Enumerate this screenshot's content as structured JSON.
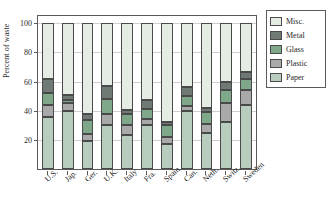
{
  "figure": {
    "title_fragment": "",
    "background": "#ffffff"
  },
  "chart_data": {
    "type": "bar",
    "stacked": true,
    "title": "",
    "subtitle": "",
    "xlabel": "",
    "ylabel": "Percent of waste",
    "ylim": [
      0,
      105
    ],
    "yticks": [
      20,
      40,
      60,
      80,
      100
    ],
    "ytick_labels": [
      "20",
      "40",
      "60",
      "80",
      "100"
    ],
    "grid": true,
    "legend_position": "right",
    "categories": [
      "U.S.",
      "Jap.",
      "Ger.",
      "U.K.",
      "Italy",
      "Fra.",
      "Spain",
      "Can.",
      "Neth.",
      "Switz.",
      "Sweden"
    ],
    "series": [
      {
        "name": "Paper",
        "color": "#b8cdbd",
        "values": [
          36,
          40,
          19.5,
          30,
          23.5,
          30,
          17,
          39.5,
          24.5,
          32,
          44
        ]
      },
      {
        "name": "Plastic",
        "color": "#a9a9a9",
        "values": [
          8,
          5,
          4.5,
          7.5,
          6.5,
          4,
          5,
          4,
          6.5,
          13,
          10
        ]
      },
      {
        "name": "Glass",
        "color": "#7fa78a",
        "values": [
          8,
          2.5,
          9.5,
          10.5,
          7.5,
          7.5,
          8.5,
          6.5,
          8,
          9.5,
          8
        ]
      },
      {
        "name": "Metal",
        "color": "#6e7a73",
        "values": [
          9.5,
          3,
          4,
          9,
          3,
          6,
          2,
          6,
          3,
          5.5,
          4.5
        ]
      },
      {
        "name": "Misc.",
        "color": "#e4ece4",
        "values": [
          38.5,
          49.5,
          62.5,
          43,
          59.5,
          52.5,
          67.5,
          44,
          58,
          40,
          34
        ]
      }
    ],
    "cumulative_tops": {
      "U.S.": {
        "Paper": 36,
        "Plastic": 44,
        "Glass": 52,
        "Metal": 61.5,
        "Misc.": 100
      },
      "Jap.": {
        "Paper": 40,
        "Plastic": 45,
        "Glass": 47.5,
        "Metal": 50.5,
        "Misc.": 100
      },
      "Ger.": {
        "Paper": 19.5,
        "Plastic": 24,
        "Glass": 33.5,
        "Metal": 37.5,
        "Misc.": 100
      },
      "U.K.": {
        "Paper": 30,
        "Plastic": 37.5,
        "Glass": 48,
        "Metal": 57,
        "Misc.": 100
      },
      "Italy": {
        "Paper": 23.5,
        "Plastic": 30,
        "Glass": 37.5,
        "Metal": 40.5,
        "Misc.": 100
      },
      "Fra.": {
        "Paper": 30,
        "Plastic": 34,
        "Glass": 41.5,
        "Metal": 47.5,
        "Misc.": 100
      },
      "Spain": {
        "Paper": 17,
        "Plastic": 22,
        "Glass": 30.5,
        "Metal": 32.5,
        "Misc.": 100
      },
      "Can.": {
        "Paper": 39.5,
        "Plastic": 43.5,
        "Glass": 50,
        "Metal": 56,
        "Misc.": 100
      },
      "Neth.": {
        "Paper": 24.5,
        "Plastic": 31,
        "Glass": 39,
        "Metal": 42,
        "Misc.": 100
      },
      "Switz.": {
        "Paper": 32,
        "Plastic": 45,
        "Glass": 54.5,
        "Metal": 60,
        "Misc.": 100
      },
      "Sweden": {
        "Paper": 44,
        "Plastic": 54,
        "Glass": 62,
        "Metal": 66.5,
        "Misc.": 100
      }
    }
  },
  "legend": {
    "entries": [
      {
        "label": "Misc.",
        "color": "#e4ece4"
      },
      {
        "label": "Metal",
        "color": "#6e7a73"
      },
      {
        "label": "Glass",
        "color": "#7fa78a"
      },
      {
        "label": "Plastic",
        "color": "#a9a9a9"
      },
      {
        "label": "Paper",
        "color": "#b8cdbd"
      }
    ]
  },
  "colors": {
    "axis": "#5a5a5a",
    "grid": "#cfcfcf",
    "text": "#1f1f1f",
    "bar_outline": "#4a4a4a"
  }
}
